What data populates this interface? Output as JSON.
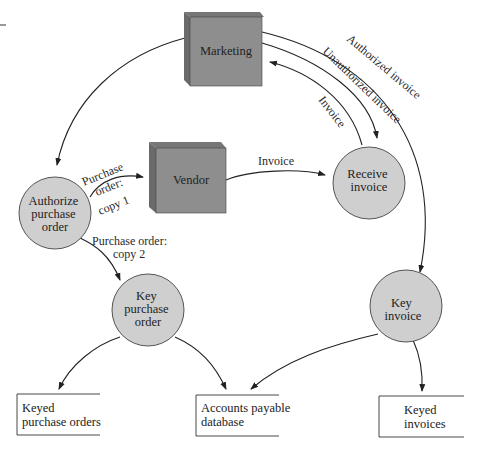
{
  "diagram": {
    "type": "data-flow",
    "entities": [
      {
        "id": "marketing",
        "label": "Marketing",
        "shape": "3d-box"
      },
      {
        "id": "vendor",
        "label": "Vendor",
        "shape": "3d-box"
      }
    ],
    "processes": [
      {
        "id": "authorize",
        "lines": [
          "Authorize",
          "purchase",
          "order"
        ]
      },
      {
        "id": "receive",
        "lines": [
          "Receive",
          "invoice"
        ]
      },
      {
        "id": "key_po",
        "lines": [
          "Key",
          "purchase",
          "order"
        ]
      },
      {
        "id": "key_inv",
        "lines": [
          "Key",
          "invoice"
        ]
      }
    ],
    "stores": [
      {
        "id": "keyed_po",
        "lines": [
          "Keyed",
          "purchase orders"
        ]
      },
      {
        "id": "ap_db",
        "lines": [
          "Accounts payable",
          "database"
        ]
      },
      {
        "id": "keyed_inv",
        "lines": [
          "Keyed",
          "invoices"
        ]
      }
    ],
    "flows": [
      {
        "from": "marketing",
        "to": "authorize",
        "label": ""
      },
      {
        "from": "authorize",
        "to": "vendor",
        "label_lines": [
          "Purchase",
          "order:",
          "copy 1"
        ]
      },
      {
        "from": "authorize",
        "to": "key_po",
        "label_lines": [
          "Purchase order:",
          "copy 2"
        ]
      },
      {
        "from": "vendor",
        "to": "receive",
        "label": "Invoice"
      },
      {
        "from": "receive",
        "to": "marketing",
        "label": "Invoice"
      },
      {
        "from": "marketing",
        "to": "receive",
        "label": "Unauthorized invoice"
      },
      {
        "from": "marketing",
        "to": "key_inv",
        "label": "Authorized invoice"
      },
      {
        "from": "key_po",
        "to": "keyed_po",
        "label": ""
      },
      {
        "from": "key_po",
        "to": "ap_db",
        "label": ""
      },
      {
        "from": "key_inv",
        "to": "ap_db",
        "label": ""
      },
      {
        "from": "key_inv",
        "to": "keyed_inv",
        "label": ""
      }
    ],
    "colors": {
      "box_face": "#8e8e8e",
      "box_side": "#6a6a6a",
      "box_top": "#777777",
      "circle_fill": "#cfcfcf",
      "line": "#222222"
    }
  }
}
